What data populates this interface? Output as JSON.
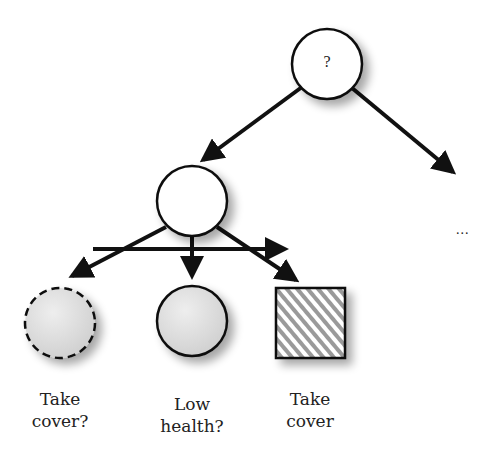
{
  "diagram": {
    "type": "behavior-tree",
    "root": {
      "label": "?"
    },
    "continuation": "...",
    "leaves": [
      {
        "id": "take-cover-check",
        "line1": "Take",
        "line2": "cover?",
        "shape": "dashed-circle"
      },
      {
        "id": "low-health-check",
        "line1": "Low",
        "line2": "health?",
        "shape": "circle"
      },
      {
        "id": "take-cover-action",
        "line1": "Take",
        "line2": "cover",
        "shape": "hatched-square"
      }
    ]
  },
  "colors": {
    "stroke": "#111111",
    "node_fill_white": "#ffffff",
    "node_fill_gray": "#dcdcdc",
    "hatch": "#9a9a9a"
  }
}
